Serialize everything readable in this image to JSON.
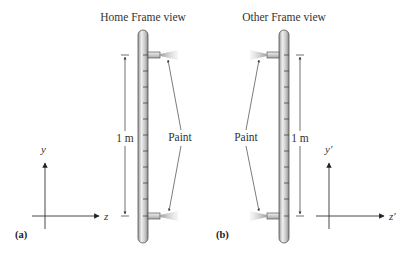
{
  "panels": [
    {
      "id": "a",
      "title": "Home Frame view",
      "panel_label": "(a)",
      "length_label": "1 m",
      "paint_label": "Paint",
      "axes": {
        "vertical": "y",
        "horizontal": "z"
      },
      "nozzle_side": "right"
    },
    {
      "id": "b",
      "title": "Other Frame view",
      "panel_label": "(b)",
      "length_label": "1 m",
      "paint_label": "Paint",
      "axes": {
        "vertical": "y′",
        "horizontal": "z′"
      },
      "nozzle_side": "left"
    }
  ],
  "colors": {
    "rod_fill_light": "#e6e6e6",
    "rod_fill_dark": "#9a9a9a",
    "line": "#333333",
    "spray": "#bdbdbd"
  }
}
